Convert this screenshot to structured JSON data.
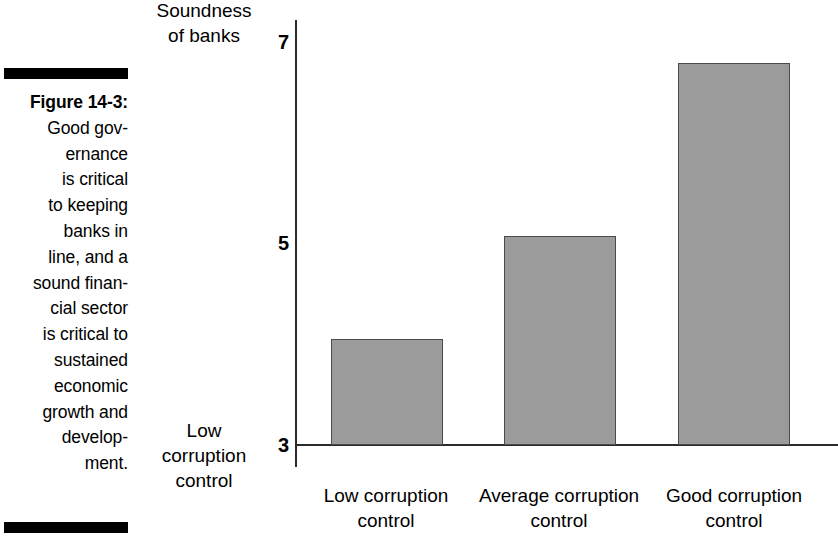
{
  "caption": {
    "figure_label": "Figure 14-3:",
    "lines": [
      "Good gov-",
      "ernance",
      "is critical",
      "to keeping",
      "banks in",
      "line, and a",
      "sound finan-",
      "cial sector",
      "is critical to",
      "sustained",
      "economic",
      "growth and",
      "develop-",
      "ment."
    ]
  },
  "chart_data": {
    "type": "bar",
    "title": "",
    "ylabel_lines": [
      "Soundness",
      "of banks"
    ],
    "ylabel": "Soundness of banks",
    "y_axis_foot_lines": [
      "Low",
      "corruption",
      "control"
    ],
    "y_axis_foot": "Low corruption control",
    "xlabel": "",
    "categories": [
      "Low corruption control",
      "Average corruption control",
      "Good corruption control"
    ],
    "category_lines": [
      [
        "Low corruption",
        "control"
      ],
      [
        "Average corruption",
        "control"
      ],
      [
        "Good corruption",
        "control"
      ]
    ],
    "values": [
      4.05,
      5.07,
      6.78
    ],
    "ylim": [
      3,
      7
    ],
    "yticks": [
      3,
      5,
      7
    ],
    "ytick_labels": [
      "3",
      "5",
      "7"
    ],
    "grid": false,
    "legend": false,
    "bar_color": "#9b9b9b",
    "bar_border_color": "#4a4a4a",
    "axis_color": "#2b2b2b"
  }
}
